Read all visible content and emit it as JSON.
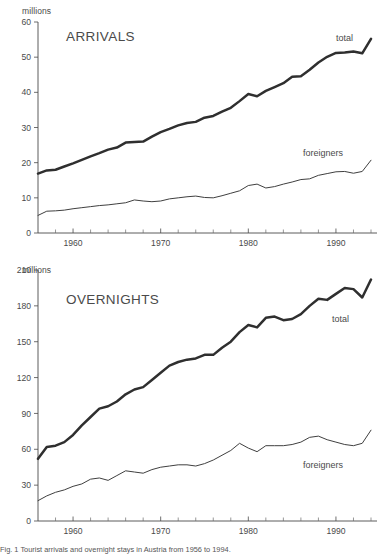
{
  "figure": {
    "caption": "Fig. 1  Tourist arrivals and overnight stays in Austria from 1956 to 1994."
  },
  "panels": [
    {
      "id": "arrivals",
      "title": "ARRIVALS",
      "unit_label": "millions",
      "total_label": "total",
      "foreigners_label": "foreigners"
    },
    {
      "id": "overnights",
      "title": "OVERNIGHTS",
      "unit_label": "millions",
      "total_label": "total",
      "foreigners_label": "foreigners"
    }
  ],
  "chart_data": [
    {
      "type": "line",
      "title": "ARRIVALS",
      "xlabel": "",
      "ylabel": "millions",
      "xlim": [
        1956,
        1994
      ],
      "ylim": [
        0,
        60
      ],
      "yticks": [
        0,
        10,
        20,
        30,
        40,
        50,
        60
      ],
      "xticks": [
        1960,
        1970,
        1980,
        1990
      ],
      "xticks_minor": [
        1958,
        1962,
        1964,
        1966,
        1968,
        1972,
        1974,
        1976,
        1978,
        1982,
        1984,
        1986,
        1988,
        1992,
        1994
      ],
      "grid": false,
      "legend": "inline-annotations",
      "x": [
        1956,
        1957,
        1958,
        1959,
        1960,
        1961,
        1962,
        1963,
        1964,
        1965,
        1966,
        1967,
        1968,
        1969,
        1970,
        1971,
        1972,
        1973,
        1974,
        1975,
        1976,
        1977,
        1978,
        1979,
        1980,
        1981,
        1982,
        1983,
        1984,
        1985,
        1986,
        1987,
        1988,
        1989,
        1990,
        1991,
        1992,
        1993,
        1994
      ],
      "series": [
        {
          "name": "total",
          "values": [
            16.9,
            17.8,
            18.0,
            18.9,
            19.8,
            20.8,
            21.8,
            22.7,
            23.7,
            24.3,
            25.7,
            25.9,
            26.0,
            27.4,
            28.7,
            29.6,
            30.6,
            31.3,
            31.6,
            32.8,
            33.3,
            34.5,
            35.6,
            37.5,
            39.5,
            38.9,
            40.4,
            41.5,
            42.6,
            44.4,
            44.6,
            46.4,
            48.5,
            50.1,
            51.2,
            51.3,
            51.6,
            51.1,
            55.2
          ]
        },
        {
          "name": "foreigners",
          "values": [
            5.0,
            6.2,
            6.3,
            6.5,
            6.9,
            7.2,
            7.5,
            7.8,
            8.0,
            8.3,
            8.6,
            9.4,
            9.1,
            8.9,
            9.1,
            9.7,
            10.0,
            10.3,
            10.5,
            10.1,
            10.0,
            10.6,
            11.3,
            12.0,
            13.5,
            13.9,
            12.8,
            13.2,
            13.9,
            14.5,
            15.2,
            15.4,
            16.4,
            16.9,
            17.4,
            17.5,
            17.0,
            17.5,
            20.7
          ]
        }
      ]
    },
    {
      "type": "line",
      "title": "OVERNIGHTS",
      "xlabel": "",
      "ylabel": "millions",
      "xlim": [
        1956,
        1994
      ],
      "ylim": [
        0,
        210
      ],
      "yticks": [
        0,
        30,
        60,
        90,
        120,
        150,
        180,
        210
      ],
      "xticks": [
        1960,
        1970,
        1980,
        1990
      ],
      "xticks_minor": [
        1958,
        1962,
        1964,
        1966,
        1968,
        1972,
        1974,
        1976,
        1978,
        1982,
        1984,
        1986,
        1988,
        1992,
        1994
      ],
      "grid": false,
      "legend": "inline-annotations",
      "x": [
        1956,
        1957,
        1958,
        1959,
        1960,
        1961,
        1962,
        1963,
        1964,
        1965,
        1966,
        1967,
        1968,
        1969,
        1970,
        1971,
        1972,
        1973,
        1974,
        1975,
        1976,
        1977,
        1978,
        1979,
        1980,
        1981,
        1982,
        1983,
        1984,
        1985,
        1986,
        1987,
        1988,
        1989,
        1990,
        1991,
        1992,
        1993,
        1994
      ],
      "series": [
        {
          "name": "total",
          "values": [
            52,
            62,
            63,
            66,
            72,
            80,
            87,
            94,
            96,
            100,
            106,
            110,
            112,
            118,
            124,
            130,
            133,
            135,
            136,
            139,
            139,
            145,
            150,
            158,
            164,
            162,
            170,
            171,
            168,
            169,
            173,
            180,
            186,
            185,
            190,
            195,
            194,
            187,
            202
          ]
        },
        {
          "name": "foreigners",
          "values": [
            17,
            21,
            24,
            26,
            29,
            31,
            35,
            36,
            34,
            38,
            42,
            41,
            40,
            43,
            45,
            46,
            47,
            47,
            46,
            48,
            51,
            55,
            59,
            65,
            61,
            58,
            63,
            63,
            63,
            64,
            66,
            70,
            71,
            68,
            66,
            64,
            63,
            65,
            76
          ]
        }
      ]
    }
  ]
}
